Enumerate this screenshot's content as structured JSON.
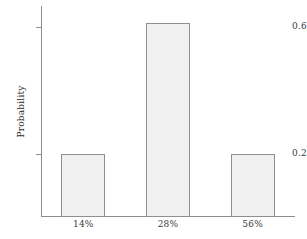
{
  "chart_data": {
    "type": "bar",
    "title": "",
    "xlabel": "",
    "ylabel": "Probability",
    "categories": [
      "14%",
      "28%",
      "56%"
    ],
    "values": [
      0.2,
      0.61,
      0.2
    ],
    "ylim": [
      0,
      0.665
    ],
    "yticks": [
      0.2,
      0.6
    ],
    "ytick_labels": [
      "0.2",
      "0.6"
    ],
    "grid": false,
    "legend": null,
    "bar_fill_color": "#f0f0f0",
    "bar_edge_color": "#8f8f8f",
    "axis_color": "#8d8d8d",
    "text_color": "#3a3a3a"
  },
  "axes": {
    "y_title": "Probability",
    "y_tick_0": "0.2",
    "y_tick_1": "0.6",
    "x_tick_0": "14%",
    "x_tick_1": "28%",
    "x_tick_2": "56%"
  }
}
